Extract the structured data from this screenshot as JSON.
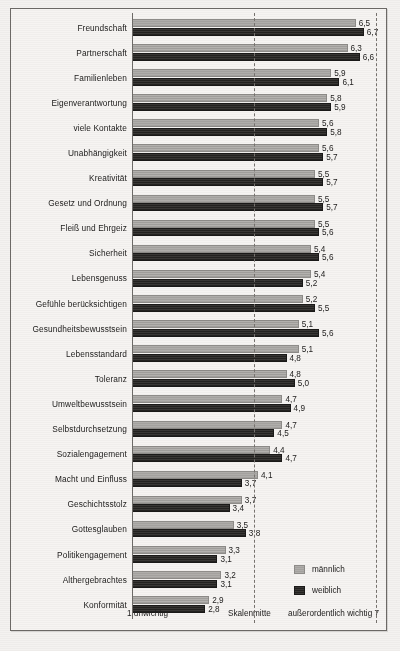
{
  "chart_data": {
    "type": "bar",
    "orientation": "horizontal",
    "title": "",
    "xlabel": "",
    "ylabel": "",
    "xlim": [
      1,
      7
    ],
    "grid": false,
    "legend_position": "bottom-right",
    "axis_captions": {
      "left": "1  unwichtig",
      "middle": "Skalenmitte",
      "right": "außerordentlich wichtig  7"
    },
    "scale_min_label": "1",
    "scale_mid_label": "4",
    "scale_max_label": "7",
    "categories": [
      "Freundschaft",
      "Partnerschaft",
      "Familienleben",
      "Eigenverantwortung",
      "viele Kontakte",
      "Unabhängigkeit",
      "Kreativität",
      "Gesetz und Ordnung",
      "Fleiß und Ehrgeiz",
      "Sicherheit",
      "Lebensgenuss",
      "Gefühle berücksichtigen",
      "Gesundheitsbewusstsein",
      "Lebensstandard",
      "Toleranz",
      "Umweltbewusstsein",
      "Selbstdurchsetzung",
      "Sozialengagement",
      "Macht und Einfluss",
      "Geschichtsstolz",
      "Gottesglauben",
      "Politikengagement",
      "Althergebrachtes",
      "Konformität"
    ],
    "series": [
      {
        "name": "männlich",
        "color": "#a8a6a3",
        "values": [
          6.5,
          6.3,
          5.9,
          5.8,
          5.6,
          5.6,
          5.5,
          5.5,
          5.5,
          5.4,
          5.4,
          5.2,
          5.1,
          5.1,
          4.8,
          4.7,
          4.7,
          4.4,
          4.1,
          3.7,
          3.5,
          3.3,
          3.2,
          2.9
        ],
        "labels": [
          "6,5",
          "6,3",
          "5,9",
          "5,8",
          "5,6",
          "5,6",
          "5,5",
          "5,5",
          "5,5",
          "5,4",
          "5,4",
          "5,2",
          "5,1",
          "5,1",
          "4,8",
          "4,7",
          "4,7",
          "4,4",
          "4,1",
          "3,7",
          "3,5",
          "3,3",
          "3,2",
          "2,9"
        ]
      },
      {
        "name": "weiblich",
        "color": "#282725",
        "values": [
          6.7,
          6.6,
          6.1,
          5.9,
          5.8,
          5.7,
          5.7,
          5.7,
          5.6,
          5.6,
          5.2,
          5.5,
          5.6,
          4.8,
          5.0,
          4.9,
          4.5,
          4.7,
          3.7,
          3.4,
          3.8,
          3.1,
          3.1,
          2.8
        ],
        "labels": [
          "6,7",
          "6,6",
          "6,1",
          "5,9",
          "5,8",
          "5,7",
          "5,7",
          "5,7",
          "5,6",
          "5,6",
          "5,2",
          "5,5",
          "5,6",
          "4,8",
          "5,0",
          "4,9",
          "4,5",
          "4,7",
          "3,7",
          "3,4",
          "3,8",
          "3,1",
          "3,1",
          "2,8"
        ]
      }
    ]
  },
  "legend": {
    "items": [
      {
        "label": "männlich",
        "key": "m"
      },
      {
        "label": "weiblich",
        "key": "w"
      }
    ]
  },
  "colors": {
    "background": "#f4f2f0",
    "frame": "#6d6a67",
    "male_bar": "#a8a6a3",
    "female_bar": "#282725",
    "text": "#222120"
  }
}
